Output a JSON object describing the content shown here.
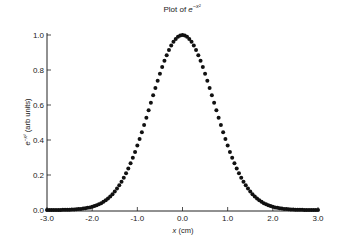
{
  "chart_data": {
    "type": "scatter",
    "title_parts": {
      "prefix": "Plot of ",
      "base": "e",
      "sup": "−x²"
    },
    "xlabel": "x (cm)",
    "xlabel_parts": {
      "var": "x",
      "unit": " (cm)"
    },
    "ylabel": "e^{-x^2} (arb units)",
    "ylabel_parts": {
      "base": "e",
      "sup": "−x²",
      "unit": " (arb units)"
    },
    "xlim": [
      -3.0,
      3.0
    ],
    "ylim": [
      0.0,
      1.0
    ],
    "xticks": [
      "-3.0",
      "-2.0",
      "-1.0",
      "0.0",
      "1.0",
      "2.0",
      "3.0"
    ],
    "xtick_values": [
      -3,
      -2,
      -1,
      0,
      1,
      2,
      3
    ],
    "yticks": [
      "0.0",
      "0.2",
      "0.4",
      "0.6",
      "0.8",
      "1.0"
    ],
    "ytick_values": [
      0,
      0.2,
      0.4,
      0.6,
      0.8,
      1.0
    ],
    "grid": false,
    "legend": null,
    "series": [
      {
        "name": "e^{-x^2}",
        "marker": "circle",
        "color": "#111111",
        "function": "exp(-x^2)",
        "x_start": -3.0,
        "x_end": 3.0,
        "x_step": 0.05,
        "sample_points": [
          {
            "x": -3.0,
            "y": 0.0001
          },
          {
            "x": -2.5,
            "y": 0.0019
          },
          {
            "x": -2.0,
            "y": 0.0183
          },
          {
            "x": -1.5,
            "y": 0.1054
          },
          {
            "x": -1.0,
            "y": 0.3679
          },
          {
            "x": -0.5,
            "y": 0.7788
          },
          {
            "x": 0.0,
            "y": 1.0
          },
          {
            "x": 0.5,
            "y": 0.7788
          },
          {
            "x": 1.0,
            "y": 0.3679
          },
          {
            "x": 1.5,
            "y": 0.1054
          },
          {
            "x": 2.0,
            "y": 0.0183
          },
          {
            "x": 2.5,
            "y": 0.0019
          },
          {
            "x": 3.0,
            "y": 0.0001
          }
        ]
      }
    ]
  },
  "layout": {
    "plot_left": 47,
    "plot_right": 318,
    "plot_top": 35,
    "plot_bottom": 210
  }
}
